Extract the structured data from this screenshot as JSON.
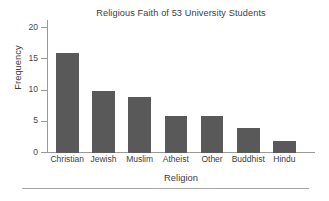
{
  "chart_data": {
    "type": "bar",
    "title": "Religious Faith of 53 University Students",
    "xlabel": "Religion",
    "ylabel": "Frequency",
    "categories": [
      "Christian",
      "Jewish",
      "Muslim",
      "Atheist",
      "Other",
      "Buddhist",
      "Hindu"
    ],
    "values": [
      16,
      10,
      9,
      6,
      6,
      4,
      2
    ],
    "ylim": [
      0,
      20
    ],
    "yticks": [
      0,
      5,
      10,
      15,
      20
    ],
    "ytick_labels": [
      "0",
      "5",
      "10",
      "15",
      "20"
    ],
    "grid": false,
    "legend": null,
    "total": 53,
    "colors": {
      "bar_fill": "#595959",
      "axis": "#9a9a9a",
      "text": "#3d3d3d",
      "background": "#ffffff",
      "rule": "#a8a8a8"
    }
  }
}
